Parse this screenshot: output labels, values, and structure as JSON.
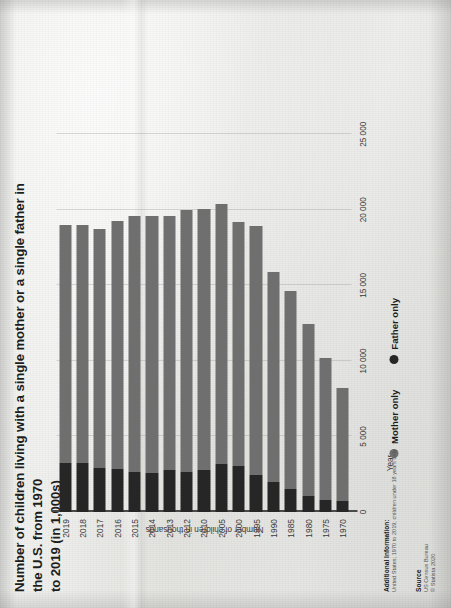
{
  "document": {
    "kind": "statista-chart-printout-photo",
    "page_rotation_degrees": -90
  },
  "title": {
    "line1": "Number of children living with a single mother or a single father in the U.S. from 1970",
    "line2": "to 2019 (in 1,000s)"
  },
  "axes": {
    "value_axis_title": "Number of children in thousands",
    "category_axis_title": "Year",
    "value_ticks": [
      "0",
      "5 000",
      "10 000",
      "15 000",
      "20 000",
      "25 000"
    ]
  },
  "legend": {
    "items": [
      {
        "label": "Mother only",
        "color": "#6f6f6f",
        "icon": "legend-dot-icon"
      },
      {
        "label": "Father only",
        "color": "#262626",
        "icon": "legend-dot-icon"
      }
    ]
  },
  "additional_information": {
    "heading": "Additional Information:",
    "text": "United States; 1970 to 2019; children under 18 years only"
  },
  "source": {
    "heading": "Source",
    "line1": "US Census Bureau",
    "line2": "© Statista 2020"
  },
  "chart_data": {
    "type": "bar",
    "orientation": "horizontal",
    "stacked": true,
    "title": "Number of children living with a single mother or a single father in the U.S. from 1970 to 2019 (in 1,000s)",
    "xlabel": "Number of children in thousands",
    "ylabel": "Year",
    "xlim": [
      0,
      27000
    ],
    "grid": true,
    "legend_position": "bottom",
    "categories": [
      "1970",
      "1975",
      "1980",
      "1985",
      "1990",
      "1995",
      "2000",
      "2005",
      "2010",
      "2012",
      "2013",
      "2014",
      "2015",
      "2016",
      "2017",
      "2018",
      "2019"
    ],
    "series": [
      {
        "name": "Mother only",
        "color": "#6f6f6f",
        "values": [
          7452,
          9365,
          11406,
          13081,
          13874,
          16477,
          16162,
          17163,
          17285,
          17355,
          16840,
          17003,
          16943,
          16454,
          15822,
          15776,
          15763
        ]
      },
      {
        "name": "Father only",
        "color": "#262626",
        "values": [
          748,
          817,
          1060,
          1554,
          1993,
          2461,
          3058,
          3206,
          2789,
          2659,
          2747,
          2612,
          2662,
          2826,
          2899,
          3234,
          3234
        ]
      }
    ],
    "totals": [
      8200,
      10182,
      12466,
      14635,
      15867,
      18938,
      19220,
      20369,
      20074,
      20014,
      19587,
      19615,
      19605,
      19280,
      18721,
      19010,
      18997
    ]
  }
}
